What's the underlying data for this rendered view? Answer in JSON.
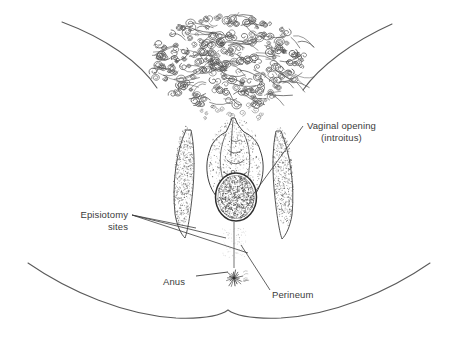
{
  "figure": {
    "background_color": "#ffffff",
    "ink_color": "#3b3b3b",
    "line_color": "#4a4a4a",
    "type": "anatomical-line-drawing"
  },
  "labels": {
    "vaginal_opening": {
      "line1": "Vaginal opening",
      "line2": "(introitus)"
    },
    "episiotomy": {
      "line1": "Episiotomy",
      "line2": "sites"
    },
    "anus": "Anus",
    "perineum": "Perineum"
  },
  "structures": [
    {
      "name": "pubic-hair",
      "description": "dense curly hair over mons pubis"
    },
    {
      "name": "labium-majus-left",
      "description": "stippled left labium majus"
    },
    {
      "name": "labium-majus-right",
      "description": "stippled right labium majus"
    },
    {
      "name": "labia-minora",
      "description": "inner folds around vestibule"
    },
    {
      "name": "vaginal-introitus",
      "description": "stippled oval opening"
    },
    {
      "name": "perineum-body",
      "description": "tissue between vulva and anus"
    },
    {
      "name": "anus",
      "description": "radiating starburst folds"
    },
    {
      "name": "thigh-left",
      "description": "upper left thigh contour"
    },
    {
      "name": "thigh-right",
      "description": "upper right thigh contour"
    },
    {
      "name": "buttock-contour",
      "description": "lower buttock and thigh curve"
    }
  ]
}
